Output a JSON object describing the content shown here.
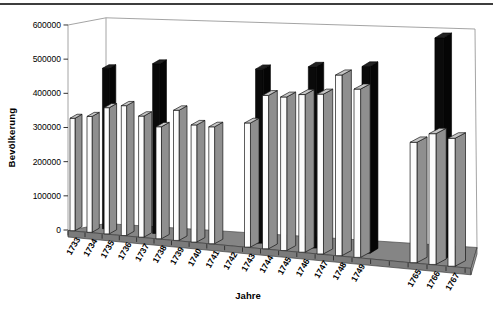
{
  "page": {
    "background": "#ffffff",
    "top_rule_color": "#3d3d3d"
  },
  "chart_data": {
    "type": "bar",
    "subtype": "3d-column",
    "title": "",
    "xlabel": "Jahre",
    "ylabel": "Bevölkerung",
    "ylim": [
      0,
      600000
    ],
    "y_ticks": [
      0,
      100000,
      200000,
      300000,
      400000,
      500000,
      600000
    ],
    "grid": "off",
    "legend": "none",
    "categories": [
      "1733",
      "1734",
      "1735",
      "1736",
      "1737",
      "1738",
      "1739",
      "1740",
      "1741",
      "1742",
      "1743",
      "1744",
      "1745",
      "1746",
      "1747",
      "1748",
      "1749",
      "1765",
      "1766",
      "1767"
    ],
    "series": [
      {
        "color": "#fcfcfc",
        "values": [
          335000,
          340000,
          365000,
          370000,
          340000,
          310000,
          355000,
          315000,
          310000,
          null,
          320000,
          390000,
          385000,
          390000,
          390000,
          435000,
          400000,
          275000,
          295000,
          285000
        ]
      },
      {
        "color": "#0a0a0a",
        "values": [
          null,
          470000,
          null,
          null,
          485000,
          null,
          null,
          null,
          null,
          null,
          475000,
          null,
          null,
          485000,
          null,
          null,
          490000,
          null,
          570000,
          null
        ]
      }
    ],
    "layout_hints": {
      "missing_category_bars": [
        "1742"
      ],
      "gap_after_category": "1749",
      "gap_slots": 2,
      "perspective": true,
      "walls": "white"
    },
    "colors": {
      "bar_front": "#fcfcfc",
      "bar_side": "#8f8f8f",
      "bar_top": "#c6c6c6",
      "bar_outline": "#161616",
      "black_bar": "#0a0a0a",
      "black_bar_top": "#222222",
      "floor_top": "#858585",
      "floor_face": "#7b7b7b",
      "frame_line": "#9a9a9a",
      "tick_color": "#333333",
      "text_color": "#000000"
    }
  }
}
